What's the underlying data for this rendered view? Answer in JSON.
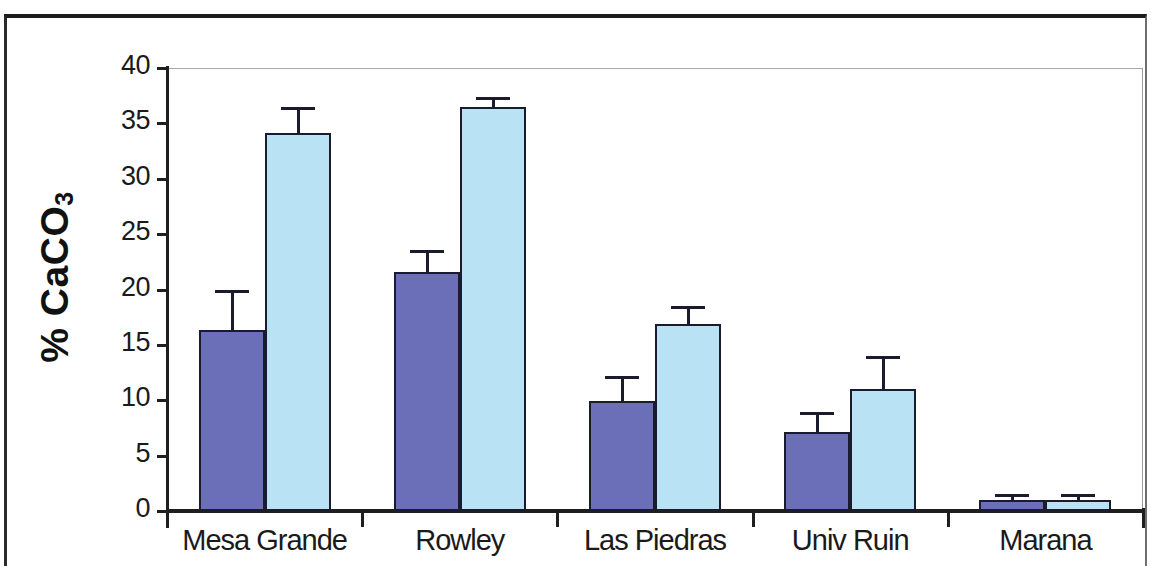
{
  "chart_data": {
    "type": "bar",
    "title": "",
    "subtitle": "",
    "xlabel": "",
    "ylabel": "% CaCO3",
    "ylabel_display": "% CaCO",
    "ylabel_subscript": "3",
    "categories": [
      "Mesa Grande",
      "Rowley",
      "Las Piedras",
      "Univ Ruin",
      "Marana"
    ],
    "ylim": [
      0,
      40
    ],
    "yticks": [
      0,
      5,
      10,
      15,
      20,
      25,
      30,
      35,
      40
    ],
    "ytick_labels": [
      "0",
      "5",
      "10",
      "15",
      "20",
      "25",
      "30",
      "35",
      "40"
    ],
    "grid": false,
    "legend": "none",
    "series": [
      {
        "name": "series-1",
        "color": "#6B6FB8",
        "values": [
          16.3,
          21.6,
          9.9,
          7.1,
          1.0
        ],
        "errors_upper": [
          20.0,
          23.6,
          12.2,
          8.9,
          1.5
        ]
      },
      {
        "name": "series-2",
        "color": "#B9E3F5",
        "values": [
          34.1,
          36.5,
          16.9,
          11.0,
          1.0
        ],
        "errors_upper": [
          36.5,
          37.4,
          18.5,
          14.0,
          1.5
        ]
      }
    ]
  },
  "axis": {
    "y_title_main": "% CaCO",
    "y_title_sub": "3"
  }
}
